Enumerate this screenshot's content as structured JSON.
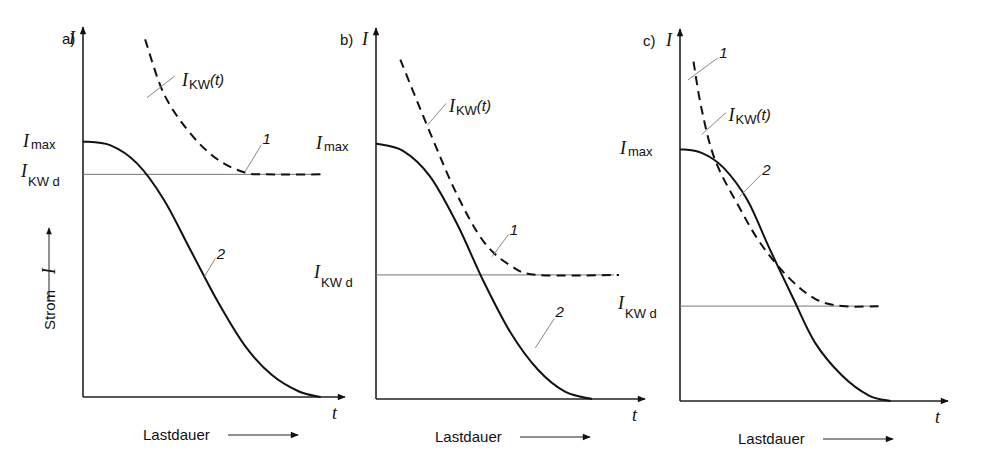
{
  "figure": {
    "y_axis_label": "Strom",
    "y_axis_symbol": "I",
    "x_axis_label": "Lastdauer",
    "x_axis_symbol": "t"
  },
  "chart_data": [
    {
      "type": "line",
      "panel": "a)",
      "ylabel": "I",
      "xlabel": "t",
      "reference_labels": {
        "upper": "I",
        "upper_sub": "max",
        "lower": "I",
        "lower_sub": "KW d"
      },
      "levels": {
        "I_max": 0.7,
        "I_KW_d": 0.61
      },
      "series": [
        {
          "name": "I_KW(t)",
          "id": "1",
          "style": "dashed",
          "label": "I",
          "label_sub": "KW",
          "label_suffix": "(t)",
          "points": [
            [
              0.23,
              0.98
            ],
            [
              0.3,
              0.83
            ],
            [
              0.4,
              0.72
            ],
            [
              0.5,
              0.65
            ],
            [
              0.6,
              0.615
            ],
            [
              0.68,
              0.61
            ],
            [
              0.9,
              0.61
            ]
          ]
        },
        {
          "name": "load current",
          "id": "2",
          "style": "solid",
          "points": [
            [
              0.0,
              0.7
            ],
            [
              0.1,
              0.69
            ],
            [
              0.2,
              0.64
            ],
            [
              0.3,
              0.54
            ],
            [
              0.4,
              0.4
            ],
            [
              0.5,
              0.26
            ],
            [
              0.6,
              0.14
            ],
            [
              0.7,
              0.06
            ],
            [
              0.8,
              0.015
            ],
            [
              0.88,
              0.0
            ]
          ]
        }
      ],
      "xlim": [
        0,
        1
      ],
      "ylim": [
        0,
        1
      ]
    },
    {
      "type": "line",
      "panel": "b)",
      "ylabel": "I",
      "xlabel": "t",
      "reference_labels": {
        "upper": "I",
        "upper_sub": "max",
        "lower": "I",
        "lower_sub": "KW d"
      },
      "levels": {
        "I_max": 0.7,
        "I_KW_d": 0.34
      },
      "series": [
        {
          "name": "I_KW(t)",
          "id": "1",
          "style": "dashed",
          "label": "I",
          "label_sub": "KW",
          "label_suffix": "(t)",
          "points": [
            [
              0.09,
              0.93
            ],
            [
              0.2,
              0.73
            ],
            [
              0.3,
              0.56
            ],
            [
              0.4,
              0.43
            ],
            [
              0.5,
              0.365
            ],
            [
              0.6,
              0.34
            ],
            [
              0.9,
              0.34
            ]
          ]
        },
        {
          "name": "load current",
          "id": "2",
          "style": "solid",
          "points": [
            [
              0.0,
              0.7
            ],
            [
              0.1,
              0.68
            ],
            [
              0.2,
              0.61
            ],
            [
              0.3,
              0.48
            ],
            [
              0.4,
              0.32
            ],
            [
              0.5,
              0.18
            ],
            [
              0.6,
              0.08
            ],
            [
              0.7,
              0.02
            ],
            [
              0.8,
              0.0
            ]
          ]
        }
      ],
      "xlim": [
        0,
        1
      ],
      "ylim": [
        0,
        1
      ]
    },
    {
      "type": "line",
      "panel": "c)",
      "ylabel": "I",
      "xlabel": "t",
      "reference_labels": {
        "upper": "I",
        "upper_sub": "max",
        "lower": "I",
        "lower_sub": "KW d"
      },
      "levels": {
        "I_max": 0.69,
        "I_KW_d": 0.26
      },
      "series": [
        {
          "name": "I_KW(t)",
          "id": "1",
          "style": "dashed",
          "label": "I",
          "label_sub": "KW",
          "label_suffix": "(t)",
          "points": [
            [
              0.05,
              0.93
            ],
            [
              0.08,
              0.8
            ],
            [
              0.13,
              0.66
            ],
            [
              0.22,
              0.53
            ],
            [
              0.3,
              0.43
            ],
            [
              0.4,
              0.34
            ],
            [
              0.5,
              0.28
            ],
            [
              0.6,
              0.26
            ],
            [
              0.75,
              0.26
            ]
          ]
        },
        {
          "name": "load current",
          "id": "2",
          "style": "solid",
          "points": [
            [
              0.0,
              0.69
            ],
            [
              0.08,
              0.68
            ],
            [
              0.16,
              0.64
            ],
            [
              0.25,
              0.55
            ],
            [
              0.33,
              0.42
            ],
            [
              0.42,
              0.28
            ],
            [
              0.5,
              0.16
            ],
            [
              0.6,
              0.07
            ],
            [
              0.7,
              0.015
            ],
            [
              0.78,
              0.0
            ]
          ]
        }
      ],
      "xlim": [
        0,
        1
      ],
      "ylim": [
        0,
        1
      ]
    }
  ]
}
